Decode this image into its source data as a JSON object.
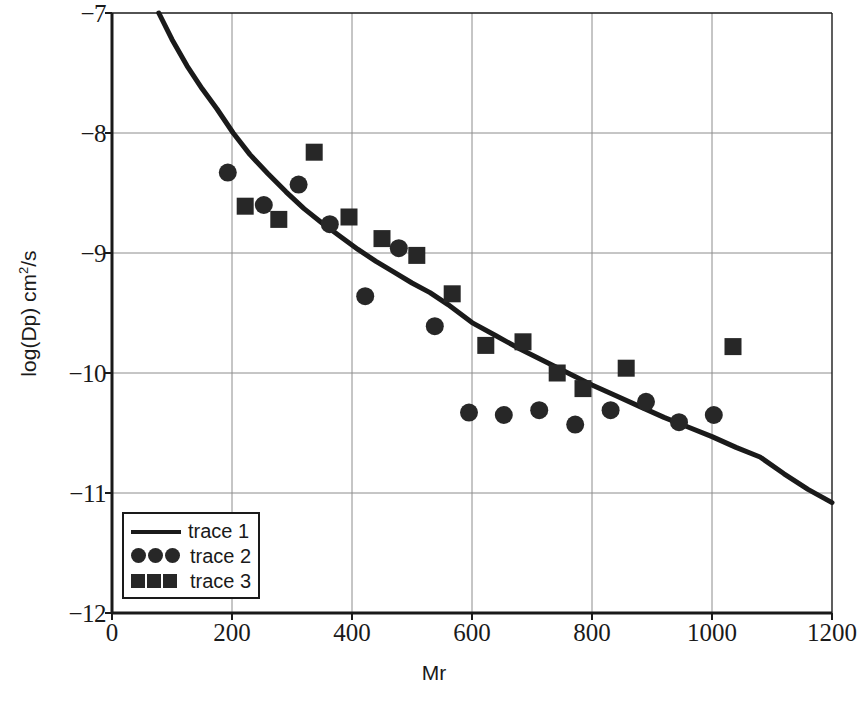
{
  "chart_data": {
    "type": "scatter",
    "title": "",
    "xlabel": "Mr",
    "ylabel": "log(Dp)  cm2/s",
    "ylabel_parts": {
      "main": "log(Dp)  cm",
      "sup": "2",
      "tail": "/s"
    },
    "xlim": [
      0,
      1200
    ],
    "ylim": [
      -12,
      -7
    ],
    "xticks": [
      0,
      200,
      400,
      600,
      800,
      1000,
      1200
    ],
    "yticks": [
      -7,
      -8,
      -9,
      -10,
      -11,
      -12
    ],
    "xtick_labels": [
      "0",
      "200",
      "400",
      "600",
      "800",
      "1000",
      "1200"
    ],
    "ytick_labels": [
      "−7",
      "−8",
      "−9",
      "−10",
      "−11",
      "−12"
    ],
    "grid": true,
    "grid_color": "#8c8c8c",
    "axis_color": "#1a1a1a",
    "marker_color": "#272727",
    "legend_position": "lower-left",
    "series": [
      {
        "name": "trace 1",
        "type": "line",
        "marker": "line",
        "points": [
          [
            78,
            -7.0
          ],
          [
            100,
            -7.22
          ],
          [
            125,
            -7.44
          ],
          [
            150,
            -7.63
          ],
          [
            175,
            -7.8
          ],
          [
            202,
            -8.0
          ],
          [
            230,
            -8.18
          ],
          [
            260,
            -8.34
          ],
          [
            290,
            -8.49
          ],
          [
            320,
            -8.63
          ],
          [
            350,
            -8.75
          ],
          [
            380,
            -8.86
          ],
          [
            410,
            -8.97
          ],
          [
            440,
            -9.07
          ],
          [
            470,
            -9.16
          ],
          [
            500,
            -9.25
          ],
          [
            530,
            -9.33
          ],
          [
            560,
            -9.43
          ],
          [
            600,
            -9.58
          ],
          [
            640,
            -9.69
          ],
          [
            680,
            -9.8
          ],
          [
            720,
            -9.9
          ],
          [
            760,
            -10.0
          ],
          [
            800,
            -10.1
          ],
          [
            840,
            -10.19
          ],
          [
            880,
            -10.28
          ],
          [
            920,
            -10.37
          ],
          [
            960,
            -10.45
          ],
          [
            1000,
            -10.53
          ],
          [
            1040,
            -10.62
          ],
          [
            1080,
            -10.7
          ],
          [
            1120,
            -10.84
          ],
          [
            1160,
            -10.97
          ],
          [
            1200,
            -11.08
          ]
        ]
      },
      {
        "name": "trace 2",
        "type": "scatter",
        "marker": "circle",
        "points": [
          [
            193,
            -8.33
          ],
          [
            253,
            -8.6
          ],
          [
            311,
            -8.43
          ],
          [
            363,
            -8.76
          ],
          [
            422,
            -9.36
          ],
          [
            478,
            -8.96
          ],
          [
            538,
            -9.61
          ],
          [
            595,
            -10.33
          ],
          [
            653,
            -10.35
          ],
          [
            712,
            -10.31
          ],
          [
            772,
            -10.43
          ],
          [
            831,
            -10.31
          ],
          [
            890,
            -10.24
          ],
          [
            945,
            -10.41
          ],
          [
            1003,
            -10.35
          ]
        ]
      },
      {
        "name": "trace 3",
        "type": "scatter",
        "marker": "square",
        "points": [
          [
            222,
            -8.61
          ],
          [
            278,
            -8.72
          ],
          [
            337,
            -8.16
          ],
          [
            395,
            -8.7
          ],
          [
            450,
            -8.88
          ],
          [
            508,
            -9.02
          ],
          [
            567,
            -9.34
          ],
          [
            623,
            -9.77
          ],
          [
            685,
            -9.74
          ],
          [
            742,
            -10.0
          ],
          [
            785,
            -10.13
          ],
          [
            857,
            -9.96
          ],
          [
            1035,
            -9.78
          ]
        ]
      }
    ]
  },
  "legend": {
    "items": [
      {
        "label": "trace 1",
        "marker": "line"
      },
      {
        "label": "trace 2",
        "marker": "circle"
      },
      {
        "label": "trace 3",
        "marker": "square"
      }
    ]
  },
  "axes": {
    "x_title": "Mr",
    "y_title_main": "log(Dp)  cm",
    "y_title_sup": "2",
    "y_title_tail": "/s"
  }
}
